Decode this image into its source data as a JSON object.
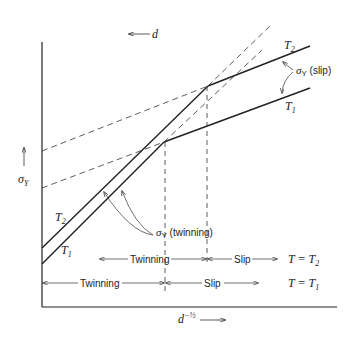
{
  "diagram": {
    "top_label": "d",
    "y_axis_label": "σ",
    "y_axis_sub": "Y",
    "x_axis_label": "d",
    "x_axis_sup": "−½",
    "curves": {
      "slip_T2": "T",
      "slip_T2_sub": "2",
      "slip_T1": "T",
      "slip_T1_sub": "1",
      "twin_T2": "T",
      "twin_T2_sub": "2",
      "twin_T1": "T",
      "twin_T1_sub": "1"
    },
    "annotations": {
      "slip_sigma": "σ",
      "slip_sigma_sub": "Y",
      "slip_text": " (slip)",
      "twin_sigma": "σ",
      "twin_sigma_sub": "Y",
      "twin_text": " (twinning)"
    },
    "regions_T2": {
      "twinning": "Twinning",
      "slip": "Slip",
      "condition": "T = T",
      "condition_sub": "2"
    },
    "regions_T1": {
      "twinning": "Twinning",
      "slip": "Slip",
      "condition": "T = T",
      "condition_sub": "1"
    }
  }
}
